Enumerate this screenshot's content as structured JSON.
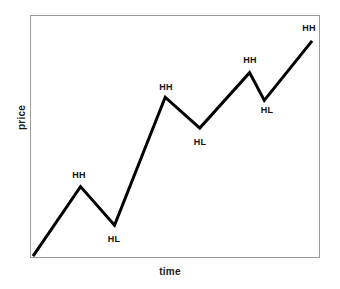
{
  "chart_data": {
    "type": "line",
    "title": "",
    "subtitle": "",
    "xlabel": "time",
    "ylabel": "price",
    "grid": false,
    "legend": null,
    "axis_ticks": {
      "x": [],
      "y": []
    },
    "xlim": [
      0,
      100
    ],
    "ylim": [
      0,
      100
    ],
    "series": [
      {
        "name": "price",
        "color": "#000000",
        "linewidth": 3,
        "x": [
          0.7,
          17.2,
          29.0,
          46.6,
          58.6,
          75.9,
          81.0,
          97.6
        ],
        "y": [
          0.4,
          29.2,
          13.2,
          66.3,
          53.5,
          76.5,
          65.0,
          89.7
        ],
        "points": [
          {
            "label": "",
            "swing": "start",
            "x": 0.7,
            "y": 0.4
          },
          {
            "label": "HH",
            "swing": "high",
            "x": 17.2,
            "y": 29.2
          },
          {
            "label": "HL",
            "swing": "low",
            "x": 29.0,
            "y": 13.2
          },
          {
            "label": "HH",
            "swing": "high",
            "x": 46.6,
            "y": 66.3
          },
          {
            "label": "HL",
            "swing": "low",
            "x": 58.6,
            "y": 53.5
          },
          {
            "label": "HH",
            "swing": "high",
            "x": 75.9,
            "y": 76.5
          },
          {
            "label": "HL",
            "swing": "low",
            "x": 81.0,
            "y": 65.0
          },
          {
            "label": "HH",
            "swing": "high",
            "x": 97.6,
            "y": 89.7
          }
        ]
      }
    ],
    "annotations": [
      {
        "text": "HH",
        "px": 79,
        "py": 175
      },
      {
        "text": "HL",
        "px": 114,
        "py": 239
      },
      {
        "text": "HH",
        "px": 166,
        "py": 87
      },
      {
        "text": "HL",
        "px": 200,
        "py": 142
      },
      {
        "text": "HH",
        "px": 250,
        "py": 60
      },
      {
        "text": "HL",
        "px": 267,
        "py": 110
      },
      {
        "text": "HH",
        "px": 309,
        "py": 28
      }
    ],
    "colors": {
      "line": "#000000",
      "frame": "#9b9b9b",
      "background": "#ffffff",
      "text": "#111111"
    }
  }
}
